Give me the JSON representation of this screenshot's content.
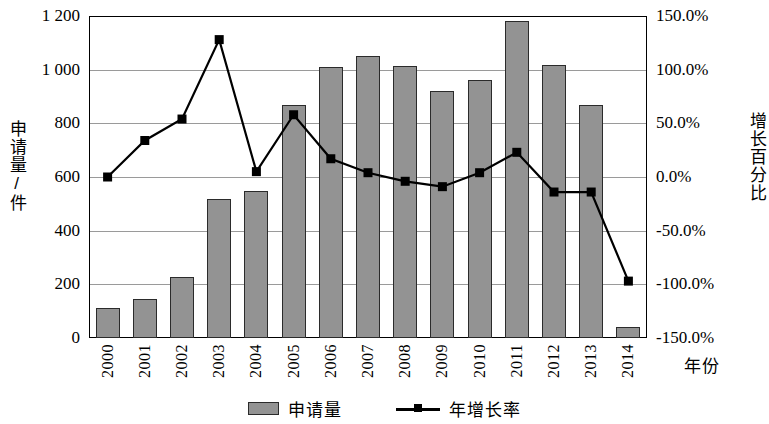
{
  "chart_data": {
    "type": "bar",
    "title": "",
    "xlabel": "年份",
    "categories": [
      "2000",
      "2001",
      "2002",
      "2003",
      "2004",
      "2005",
      "2006",
      "2007",
      "2008",
      "2009",
      "2010",
      "2011",
      "2012",
      "2013",
      "2014"
    ],
    "series": [
      {
        "name": "申请量",
        "type": "bar",
        "axis": "left",
        "unit": "件",
        "values": [
          110,
          147,
          227,
          518,
          547,
          867,
          1010,
          1052,
          1013,
          920,
          962,
          1182,
          1018,
          870,
          40
        ]
      },
      {
        "name": "年增长率",
        "type": "line",
        "axis": "right",
        "unit": "%",
        "values": [
          0.0,
          34.0,
          54.0,
          128.0,
          5.0,
          58.0,
          17.0,
          4.0,
          -4.0,
          -9.0,
          4.0,
          23.0,
          -14.0,
          -14.0,
          -97.0
        ]
      }
    ],
    "left_axis": {
      "label": "申请量/件",
      "min": 0,
      "max": 1200,
      "step": 200,
      "ticks": [
        "0",
        "200",
        "400",
        "600",
        "800",
        "1 000",
        "1 200"
      ]
    },
    "right_axis": {
      "label": "增长百分比",
      "min": -150,
      "max": 150,
      "step": 50,
      "ticks": [
        "-150.0%",
        "-100.0%",
        "-50.0%",
        "0.0%",
        "50.0%",
        "100.0%",
        "150.0%"
      ]
    },
    "grid": true,
    "legend_position": "bottom",
    "legend": [
      "申请量",
      "年增长率"
    ],
    "colors": {
      "bar_fill": "#939393",
      "bar_stroke": "#2b2b2b",
      "line": "#000000",
      "marker": "#000000",
      "gridline": "#9a9a9a",
      "frame": "#000000"
    }
  }
}
